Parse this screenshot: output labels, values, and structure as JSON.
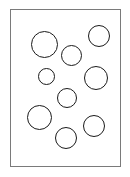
{
  "figure": {
    "canvas": {
      "width": 130,
      "height": 177
    },
    "background_color": "#ffffff",
    "frame": {
      "name": "page-border",
      "x": 10,
      "y": 9,
      "width": 111,
      "height": 158,
      "border_color": "#7a7a7a",
      "border_width": 1,
      "fill_color": "#ffffff"
    },
    "shape_style": {
      "stroke_color": "#1a1a1a",
      "stroke_width": 1.5,
      "fill_color": "none"
    },
    "count": 10
  },
  "chart_data": {
    "type": "scatter",
    "title": "",
    "xlabel": "",
    "ylabel": "",
    "xlim": [
      10,
      121
    ],
    "ylim": [
      9,
      167
    ],
    "grid": false,
    "legend": "none",
    "marker": "open-circle",
    "series": [
      {
        "name": "circles",
        "points": [
          {
            "id": 1,
            "label": "top-left-large",
            "cx": 44,
            "cy": 44,
            "r": 13.5
          },
          {
            "id": 2,
            "label": "top-right",
            "cx": 99,
            "cy": 36,
            "r": 11
          },
          {
            "id": 3,
            "label": "upper-middle",
            "cx": 71.5,
            "cy": 55.5,
            "r": 10.5
          },
          {
            "id": 4,
            "label": "left-small",
            "cx": 46.5,
            "cy": 76.5,
            "r": 8.5
          },
          {
            "id": 5,
            "label": "right-middle-large",
            "cx": 96,
            "cy": 78,
            "r": 12
          },
          {
            "id": 6,
            "label": "center",
            "cx": 67,
            "cy": 98,
            "r": 10
          },
          {
            "id": 7,
            "label": "lower-left-large",
            "cx": 39.5,
            "cy": 117.5,
            "r": 12.5
          },
          {
            "id": 8,
            "label": "lower-right",
            "cx": 94,
            "cy": 126,
            "r": 11
          },
          {
            "id": 9,
            "label": "bottom-center",
            "cx": 66,
            "cy": 138,
            "r": 11
          },
          {
            "id": 10,
            "label": "upper-right-edge",
            "cx": 99,
            "cy": 36,
            "r": 11,
            "duplicate_of": 2
          }
        ]
      }
    ]
  }
}
